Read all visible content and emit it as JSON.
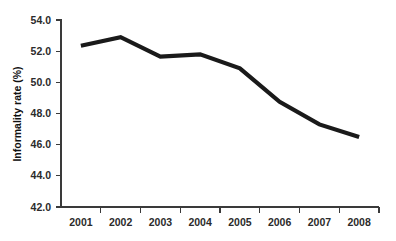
{
  "chart_data": {
    "type": "line",
    "title": "",
    "subtitle": "",
    "xlabel": "",
    "ylabel": "Informality rate (%)",
    "categories": [
      "2001",
      "2002",
      "2003",
      "2004",
      "2005",
      "2006",
      "2007",
      "2008"
    ],
    "x": [
      2001,
      2002,
      2003,
      2004,
      2005,
      2006,
      2007,
      2008
    ],
    "values": [
      52.35,
      52.9,
      51.65,
      51.8,
      50.9,
      48.75,
      47.3,
      46.5
    ],
    "series": [
      {
        "name": "Informality rate",
        "values": [
          52.35,
          52.9,
          51.65,
          51.8,
          50.9,
          48.75,
          47.3,
          46.5
        ],
        "color": "#1a1a1a"
      }
    ],
    "ylim": [
      42.0,
      54.0
    ],
    "y_ticks": [
      "42.0",
      "44.0",
      "46.0",
      "48.0",
      "50.0",
      "52.0",
      "54.0"
    ],
    "y_tick_values": [
      42.0,
      44.0,
      46.0,
      48.0,
      50.0,
      52.0,
      54.0
    ],
    "x_ticks": [
      "2001",
      "2002",
      "2003",
      "2004",
      "2005",
      "2006",
      "2007",
      "2008"
    ],
    "grid": false,
    "legend": false,
    "legend_position": "none",
    "line_color": "#1a1a1a",
    "axis_color": "#3a3a3a",
    "background_color": "#ffffff",
    "annotations": []
  }
}
